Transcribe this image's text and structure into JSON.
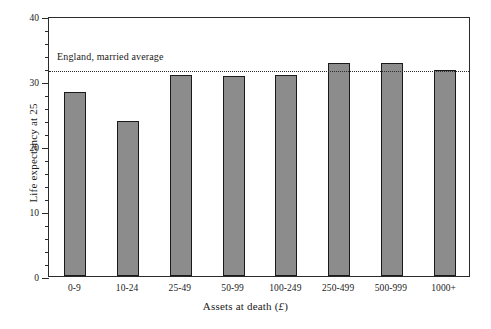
{
  "chart_data": {
    "type": "bar",
    "title": "",
    "xlabel": "Assets at death (£)",
    "ylabel": "Life expectancy at 25",
    "categories": [
      "0-9",
      "10-24",
      "25-49",
      "50-99",
      "100-249",
      "250-499",
      "500-999",
      "1000+"
    ],
    "values": [
      28.3,
      23.9,
      31.0,
      30.7,
      30.9,
      32.8,
      32.8,
      31.7
    ],
    "ylim": [
      0,
      40
    ],
    "yticks": [
      0,
      10,
      20,
      30,
      40
    ],
    "ytick_labels": [
      "0",
      "10",
      "20",
      "30",
      "40"
    ],
    "yminor_step": 2,
    "grid": false,
    "legend": "none",
    "annotations": [
      {
        "id": "england-married-average",
        "label": "England, married average",
        "value": 31.8,
        "line_style": "dotted"
      }
    ],
    "bar_fill": "#8c8c8c",
    "bar_edge": "#1a1a1a",
    "axis_color": "#2b2b2b",
    "background": "#ffffff"
  }
}
